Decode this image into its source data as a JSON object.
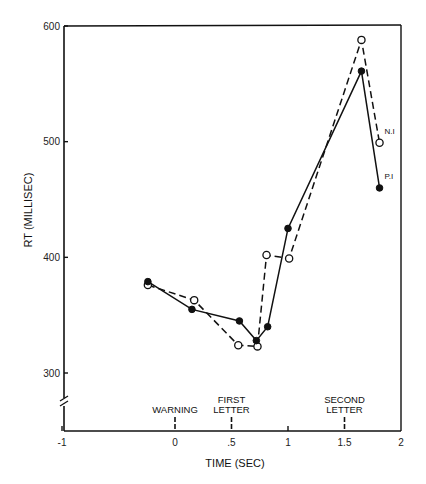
{
  "chart_data": {
    "type": "line",
    "title": "",
    "xlabel": "TIME (SEC)",
    "ylabel": "RT (MILLISEC)",
    "xlim": [
      -1.5,
      2
    ],
    "ylim": [
      260,
      600
    ],
    "x_ticks": [
      {
        "value": -1,
        "label": "-1"
      },
      {
        "value": 0,
        "label": "0"
      },
      {
        "value": 0.5,
        "label": ".5"
      },
      {
        "value": 1,
        "label": "1"
      },
      {
        "value": 1.5,
        "label": "1.5"
      },
      {
        "value": 2,
        "label": "2"
      }
    ],
    "y_ticks": [
      {
        "value": 300,
        "label": "300"
      },
      {
        "value": 400,
        "label": "400"
      },
      {
        "value": 500,
        "label": "500"
      },
      {
        "value": 600,
        "label": "600"
      }
    ],
    "y_axis_break": true,
    "grid": false,
    "annotations": [
      {
        "x": 0,
        "lines": [
          "WARNING"
        ]
      },
      {
        "x": 0.5,
        "lines": [
          "FIRST",
          "LETTER"
        ]
      },
      {
        "x": 1.5,
        "lines": [
          "SECOND",
          "LETTER"
        ]
      }
    ],
    "series": [
      {
        "name": "N.I",
        "style": "dashed",
        "marker": "open-circle",
        "x": [
          -0.24,
          0.17,
          0.56,
          0.73,
          0.81,
          1.01,
          1.65,
          1.81
        ],
        "values": [
          376,
          363,
          324,
          323,
          402,
          399,
          588,
          499
        ]
      },
      {
        "name": "P.I",
        "style": "solid",
        "marker": "filled-circle",
        "x": [
          -0.24,
          0.15,
          0.57,
          0.72,
          0.82,
          1.0,
          1.65,
          1.81
        ],
        "values": [
          379,
          355,
          345,
          328,
          340,
          425,
          561,
          460
        ]
      }
    ],
    "legend": "inline labels at series end points"
  }
}
